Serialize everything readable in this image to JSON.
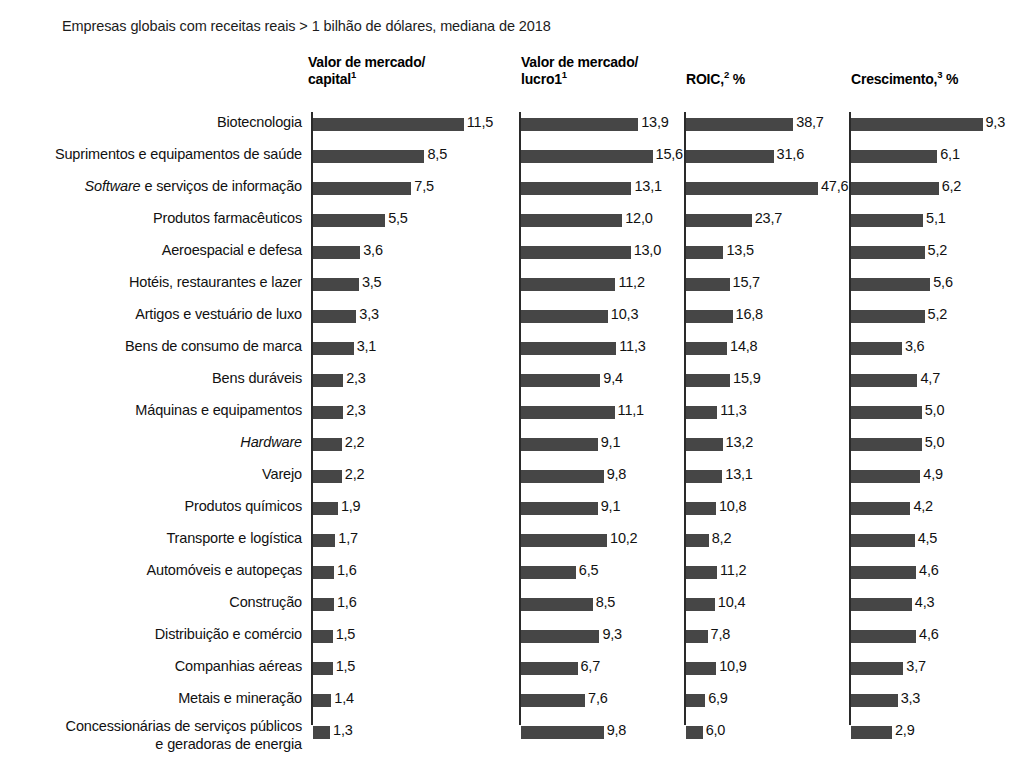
{
  "subtitle": "Empresas globais com receitas reais > 1 bilhão de dólares, mediana de 2018",
  "headers": {
    "col1_line1": "Valor de mercado/",
    "col1_line2": "capital",
    "col1_sup": "1",
    "col2_line1": "Valor de mercado/",
    "col2_line2": "lucro1",
    "col2_sup": "1",
    "col3_text": "ROIC,",
    "col3_sup": "2",
    "col3_suffix": " %",
    "col4_text": "Crescimento,",
    "col4_sup": "3",
    "col4_suffix": " %"
  },
  "colors": {
    "bar": "#464646",
    "axis": "#2a2a2a",
    "text": "#111111",
    "background": "#ffffff"
  },
  "chart_data": {
    "type": "bar",
    "title": "Empresas globais com receitas reais > 1 bilhão de dólares, mediana de 2018",
    "orientation": "horizontal",
    "grid": false,
    "legend": "none",
    "categories": [
      "Biotecnologia",
      "Suprimentos e equipamentos de saúde",
      "Software e serviços de informação",
      "Produtos farmacêuticos",
      "Aeroespacial e defesa",
      "Hotéis, restaurantes e lazer",
      "Artigos e vestuário de luxo",
      "Bens de consumo de marca",
      "Bens duráveis",
      "Máquinas e equipamentos",
      "Hardware",
      "Varejo",
      "Produtos químicos",
      "Transporte e logística",
      "Automóveis e autopeças",
      "Construção",
      "Distribuição e comércio",
      "Companhias aéreas",
      "Metais e mineração",
      "Concessionárias de serviços públicos e geradoras de energia"
    ],
    "category_labels_html": [
      "Biotecnologia",
      "Suprimentos e equipamentos de saúde",
      "<i>Software</i> e serviços de informação",
      "Produtos farmacêuticos",
      "Aeroespacial e defesa",
      "Hotéis, restaurantes e lazer",
      "Artigos e vestuário de luxo",
      "Bens de consumo de marca",
      "Bens duráveis",
      "Máquinas e equipamentos",
      "<i>Hardware</i>",
      "Varejo",
      "Produtos químicos",
      "Transporte e logística",
      "Automóveis e autopeças",
      "Construção",
      "Distribuição e comércio",
      "Companhias aéreas",
      "Metais e mineração",
      "Concessionárias de serviços públicos<br>e geradoras de energia"
    ],
    "series": [
      {
        "name": "Valor de mercado/capital",
        "unit": "x",
        "max_scale": 12.2,
        "values": [
          11.5,
          8.5,
          7.5,
          5.5,
          3.6,
          3.5,
          3.3,
          3.1,
          2.3,
          2.3,
          2.2,
          2.2,
          1.9,
          1.7,
          1.6,
          1.6,
          1.5,
          1.5,
          1.4,
          1.3
        ],
        "labels": [
          "11,5",
          "8,5",
          "7,5",
          "5,5",
          "3,6",
          "3,5",
          "3,3",
          "3,1",
          "2,3",
          "2,3",
          "2,2",
          "2,2",
          "1,9",
          "1,7",
          "1,6",
          "1,6",
          "1,5",
          "1,5",
          "1,4",
          "1,3"
        ]
      },
      {
        "name": "Valor de mercado/lucro",
        "unit": "x",
        "max_scale": 16.6,
        "values": [
          13.9,
          15.6,
          13.1,
          12.0,
          13.0,
          11.2,
          10.3,
          11.3,
          9.4,
          11.1,
          9.1,
          9.8,
          9.1,
          10.2,
          6.5,
          8.5,
          9.3,
          6.7,
          7.6,
          9.8
        ],
        "labels": [
          "13,9",
          "15,6",
          "13,1",
          "12,0",
          "13,0",
          "11,2",
          "10,3",
          "11,3",
          "9,4",
          "11,1",
          "9,1",
          "9,8",
          "9,1",
          "10,2",
          "6,5",
          "8,5",
          "9,3",
          "6,7",
          "7,6",
          "9,8"
        ]
      },
      {
        "name": "ROIC",
        "unit": "%",
        "max_scale": 50.5,
        "values": [
          38.7,
          31.6,
          47.6,
          23.7,
          13.5,
          15.7,
          16.8,
          14.8,
          15.9,
          11.3,
          13.2,
          13.1,
          10.8,
          8.2,
          11.2,
          10.4,
          7.8,
          10.9,
          6.9,
          6.0
        ],
        "labels": [
          "38,7",
          "31,6",
          "47,6",
          "23,7",
          "13,5",
          "15,7",
          "16,8",
          "14,8",
          "15,9",
          "11,3",
          "13,2",
          "13,1",
          "10,8",
          "8,2",
          "11,2",
          "10,4",
          "7,8",
          "10,9",
          "6,9",
          "6,0"
        ]
      },
      {
        "name": "Crescimento",
        "unit": "%",
        "max_scale": 9.9,
        "values": [
          9.3,
          6.1,
          6.2,
          5.1,
          5.2,
          5.6,
          5.2,
          3.6,
          4.7,
          5.0,
          5.0,
          4.9,
          4.2,
          4.5,
          4.6,
          4.3,
          4.6,
          3.7,
          3.3,
          2.9
        ],
        "labels": [
          "9,3",
          "6,1",
          "6,2",
          "5,1",
          "5,2",
          "5,6",
          "5,2",
          "3,6",
          "4,7",
          "5,0",
          "5,0",
          "4,9",
          "4,2",
          "4,5",
          "4,6",
          "4,3",
          "4,6",
          "3,7",
          "3,3",
          "2,9"
        ]
      }
    ]
  }
}
